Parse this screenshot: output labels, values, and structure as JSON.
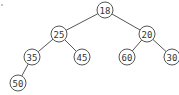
{
  "diagram": {
    "type": "binary-tree",
    "colors": {
      "stroke": "#555555",
      "text": "#333333",
      "fill": "#ffffff"
    },
    "node_radius": 8,
    "nodes": [
      {
        "id": "n18",
        "label": "18",
        "x": 105,
        "y": 10
      },
      {
        "id": "n25",
        "label": "25",
        "x": 59,
        "y": 34
      },
      {
        "id": "n20",
        "label": "20",
        "x": 147,
        "y": 34
      },
      {
        "id": "n35",
        "label": "35",
        "x": 32,
        "y": 57
      },
      {
        "id": "n45",
        "label": "45",
        "x": 82,
        "y": 57
      },
      {
        "id": "n60",
        "label": "60",
        "x": 127,
        "y": 57
      },
      {
        "id": "n30",
        "label": "30",
        "x": 172,
        "y": 57
      },
      {
        "id": "n50",
        "label": "50",
        "x": 18,
        "y": 83
      }
    ],
    "edges": [
      {
        "from": "n18",
        "to": "n25"
      },
      {
        "from": "n18",
        "to": "n20"
      },
      {
        "from": "n25",
        "to": "n35"
      },
      {
        "from": "n25",
        "to": "n45"
      },
      {
        "from": "n20",
        "to": "n60"
      },
      {
        "from": "n20",
        "to": "n30"
      },
      {
        "from": "n35",
        "to": "n50"
      }
    ]
  }
}
